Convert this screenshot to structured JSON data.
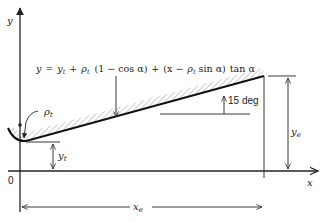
{
  "diagram": {
    "equation": {
      "y_lhs": "y",
      "equals": "=",
      "yt": "y",
      "yt_sub": "t",
      "plus1": "+",
      "rho": "ρ",
      "rho_sub": "t",
      "term1": "(1 − cos α)",
      "plus2": "+",
      "term2_open": "(x −",
      "rho2": "ρ",
      "rho2_sub": "t",
      "term2_close": "sin α)",
      "tan": "tan α"
    },
    "labels": {
      "y_axis": "y",
      "x_axis": "x",
      "origin": "0",
      "rho_t": "ρ",
      "rho_t_sub": "t",
      "y_t": "y",
      "y_t_sub": "t",
      "y_e": "y",
      "y_e_sub": "e",
      "x_e": "x",
      "x_e_sub": "e",
      "angle": "15 deg"
    },
    "colors": {
      "line": "#222222",
      "hatch": "#888888",
      "background": "#ffffff"
    }
  }
}
